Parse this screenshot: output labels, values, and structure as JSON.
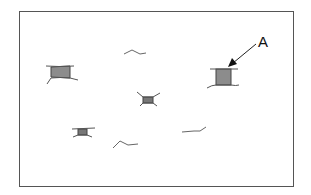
{
  "diagram": {
    "frame": {
      "x": 19,
      "y": 11,
      "width": 274,
      "height": 175,
      "stroke": "#555555"
    },
    "label": {
      "text": "A",
      "x": 258,
      "y": 33
    },
    "arrow": {
      "from": [
        256,
        44
      ],
      "to": [
        229,
        66
      ]
    },
    "colors": {
      "fill": "#8c8c8c",
      "stroke": "#444444",
      "line": "#666666"
    },
    "filled_objects": [
      {
        "name": "object-left",
        "x": 50,
        "y": 67,
        "w": 20,
        "h": 11
      },
      {
        "name": "object-a",
        "x": 216,
        "y": 69,
        "w": 15,
        "h": 16
      },
      {
        "name": "object-center",
        "x": 143,
        "y": 96,
        "w": 10,
        "h": 7
      },
      {
        "name": "object-bottom-left",
        "x": 77,
        "y": 128,
        "w": 9,
        "h": 7
      }
    ],
    "squiggles": [
      {
        "name": "squiggle-top",
        "points": "124,54 132,50 140,54 146,53"
      },
      {
        "name": "squiggle-bottom",
        "points": "113,148 120,141 128,145 138,144"
      },
      {
        "name": "squiggle-right",
        "points": "182,132 194,131 200,131 206,127"
      }
    ]
  }
}
